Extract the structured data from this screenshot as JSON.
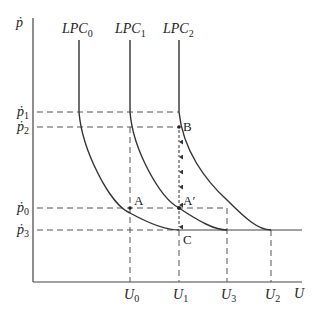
{
  "diagram": {
    "type": "economics-phillips-curve",
    "axes": {
      "y_label": "ṗ",
      "x_label": "U"
    },
    "curves": [
      {
        "label_main": "LPC",
        "label_sub": "0"
      },
      {
        "label_main": "LPC",
        "label_sub": "1"
      },
      {
        "label_main": "LPC",
        "label_sub": "2"
      }
    ],
    "y_ticks": [
      {
        "main": "ṗ",
        "sub": "1"
      },
      {
        "main": "ṗ",
        "sub": "2"
      },
      {
        "main": "ṗ",
        "sub": "0"
      },
      {
        "main": "ṗ",
        "sub": "3"
      }
    ],
    "x_ticks": [
      {
        "main": "U",
        "sub": "0"
      },
      {
        "main": "U",
        "sub": "1"
      },
      {
        "main": "U",
        "sub": "3"
      },
      {
        "main": "U",
        "sub": "2"
      }
    ],
    "points": {
      "A": "A",
      "A_prime": "A′",
      "B": "B",
      "C": "C"
    },
    "colors": {
      "line": "#333333",
      "dash": "#555555"
    }
  }
}
